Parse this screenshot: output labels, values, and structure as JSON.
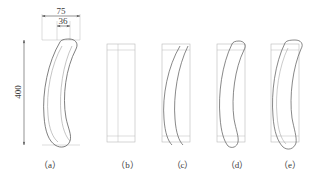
{
  "drawing": {
    "title": "",
    "type": "engineering-orthographic",
    "background": "#ffffff",
    "line_color": "#555555",
    "thin_line_color": "#b8b8b8",
    "dimension_color": "#4a4a4a",
    "text_color": "#3a3a3a"
  },
  "dimensions": [
    {
      "id": "width-overall",
      "value": "75",
      "orientation": "horizontal",
      "position": "top-outer"
    },
    {
      "id": "width-inner",
      "value": "36",
      "orientation": "horizontal",
      "position": "top-inner"
    },
    {
      "id": "height-overall",
      "value": "400",
      "orientation": "vertical",
      "position": "left"
    }
  ],
  "figures": [
    {
      "key": "a",
      "caption": "（a）",
      "has_rectangle": false,
      "has_curve": true,
      "curve_offset": 0,
      "description": "curved bar profile with dimensions"
    },
    {
      "key": "b",
      "caption": "（b）",
      "has_rectangle": true,
      "has_curve": false,
      "curve_offset": 0,
      "description": "rectangular blank with inner lines"
    },
    {
      "key": "c",
      "caption": "（c）",
      "has_rectangle": true,
      "has_curve": true,
      "curve_offset": 0,
      "description": "curve nested at left of blank"
    },
    {
      "key": "d",
      "caption": "（d）",
      "has_rectangle": true,
      "has_curve": true,
      "curve_offset": 5,
      "description": "curve shifted right within blank"
    },
    {
      "key": "e",
      "caption": "（e）",
      "has_rectangle": true,
      "has_curve": true,
      "curve_offset": 9,
      "description": "curve fully bowed beyond blank"
    }
  ],
  "captions": [
    "（a）",
    "（b）",
    "（c）",
    "（d）",
    "（e）"
  ]
}
